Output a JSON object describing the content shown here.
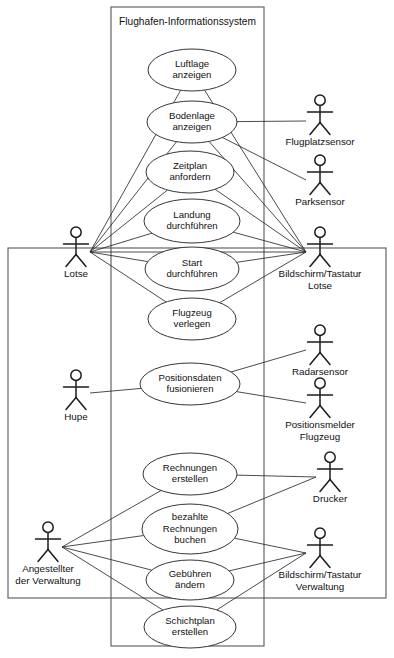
{
  "diagram": {
    "kind": "uml-use-case-diagram",
    "system": {
      "title": "Flughafen-Informationssystem",
      "box": {
        "x": 111,
        "y": 7,
        "width": 153,
        "height": 639
      }
    },
    "outer_box": {
      "x": 8,
      "y": 248,
      "width": 378,
      "height": 350
    },
    "colors": {
      "stroke": "#2b2b2b",
      "box_stroke": "#58585a",
      "fill": "#ffffff",
      "text": "#111111"
    },
    "use_cases": [
      {
        "id": "uc-luftlage-anzeigen",
        "lines": [
          "Luftlage",
          "anzeigen"
        ],
        "cx": 192,
        "cy": 70,
        "rx": 44,
        "ry": 21
      },
      {
        "id": "uc-bodenlage-anzeigen",
        "lines": [
          "Bodenlage",
          "anzeigen"
        ],
        "cx": 192,
        "cy": 122,
        "rx": 45,
        "ry": 21
      },
      {
        "id": "uc-zeitplan-anfordern",
        "lines": [
          "Zeitplan",
          "anfordern"
        ],
        "cx": 190,
        "cy": 172,
        "rx": 44,
        "ry": 21
      },
      {
        "id": "uc-landung-durchfuehren",
        "lines": [
          "Landung",
          "durchführen"
        ],
        "cx": 192,
        "cy": 221,
        "rx": 48,
        "ry": 22
      },
      {
        "id": "uc-start-durchfuehren",
        "lines": [
          "Start",
          "durchführen"
        ],
        "cx": 192,
        "cy": 269,
        "rx": 47,
        "ry": 22
      },
      {
        "id": "uc-flugzeug-verlegen",
        "lines": [
          "Flugzeug",
          "verlegen"
        ],
        "cx": 192,
        "cy": 319,
        "rx": 44,
        "ry": 21
      },
      {
        "id": "uc-positionsdaten-fusionieren",
        "lines": [
          "Positionsdaten",
          "fusionieren"
        ],
        "cx": 190,
        "cy": 384,
        "rx": 50,
        "ry": 21
      },
      {
        "id": "uc-rechnungen-erstellen",
        "lines": [
          "Rechnungen",
          "erstellen"
        ],
        "cx": 190,
        "cy": 474,
        "rx": 47,
        "ry": 21
      },
      {
        "id": "uc-bezahlte-rechnungen-buchen",
        "lines": [
          "bezahlte",
          "Rechnungen",
          "buchen"
        ],
        "cx": 190,
        "cy": 529,
        "rx": 48,
        "ry": 25
      },
      {
        "id": "uc-gebuehren-aendern",
        "lines": [
          "Gebühren",
          "ändern"
        ],
        "cx": 190,
        "cy": 580,
        "rx": 44,
        "ry": 20
      },
      {
        "id": "uc-schichtplan-erstellen",
        "lines": [
          "Schichtplan",
          "erstellen"
        ],
        "cx": 190,
        "cy": 627,
        "rx": 46,
        "ry": 21
      }
    ],
    "actors": [
      {
        "id": "actor-lotse",
        "lines": [
          "Lotse"
        ],
        "x": 76,
        "y": 227,
        "hub_x": 90,
        "hub_y": 252,
        "side": "right"
      },
      {
        "id": "actor-hupe",
        "lines": [
          "Hupe"
        ],
        "x": 76,
        "y": 370,
        "hub_x": 90,
        "hub_y": 393,
        "side": "right"
      },
      {
        "id": "actor-angestellter-der-verwaltung",
        "lines": [
          "Angestellter",
          "der Verwaltung"
        ],
        "x": 48,
        "y": 522,
        "hub_x": 62,
        "hub_y": 547,
        "side": "right"
      },
      {
        "id": "actor-flugplatzsensor",
        "lines": [
          "Flugplatzsensor"
        ],
        "x": 320,
        "y": 95,
        "hub_x": 306,
        "hub_y": 121,
        "side": "left"
      },
      {
        "id": "actor-parksensor",
        "lines": [
          "Parksensor"
        ],
        "x": 320,
        "y": 155,
        "hub_x": 306,
        "hub_y": 180,
        "side": "left"
      },
      {
        "id": "actor-bildschirm-tastatur-lotse",
        "lines": [
          "Bildschirm/Tastatur",
          "Lotse"
        ],
        "x": 320,
        "y": 227,
        "hub_x": 306,
        "hub_y": 252,
        "side": "left"
      },
      {
        "id": "actor-radarsensor",
        "lines": [
          "Radarsensor"
        ],
        "x": 320,
        "y": 325,
        "hub_x": 306,
        "hub_y": 350,
        "side": "left"
      },
      {
        "id": "actor-positionsmelder-flugzeug",
        "lines": [
          "Positionsmelder",
          "Flugzeug"
        ],
        "x": 320,
        "y": 378,
        "hub_x": 306,
        "hub_y": 403,
        "side": "left"
      },
      {
        "id": "actor-drucker",
        "lines": [
          "Drucker"
        ],
        "x": 330,
        "y": 452,
        "hub_x": 316,
        "hub_y": 477,
        "side": "left"
      },
      {
        "id": "actor-bildschirm-tastatur-verwaltung",
        "lines": [
          "Bildschirm/Tastatur",
          "Verwaltung"
        ],
        "x": 320,
        "y": 528,
        "hub_x": 306,
        "hub_y": 553,
        "side": "left"
      }
    ],
    "associations": [
      {
        "from": "actor-lotse",
        "to": "uc-luftlage-anzeigen"
      },
      {
        "from": "actor-lotse",
        "to": "uc-bodenlage-anzeigen"
      },
      {
        "from": "actor-lotse",
        "to": "uc-zeitplan-anfordern"
      },
      {
        "from": "actor-lotse",
        "to": "uc-landung-durchfuehren"
      },
      {
        "from": "actor-lotse",
        "to": "uc-start-durchfuehren"
      },
      {
        "from": "actor-lotse",
        "to": "uc-flugzeug-verlegen"
      },
      {
        "from": "actor-lotse",
        "to": "actor-bildschirm-tastatur-lotse"
      },
      {
        "from": "uc-luftlage-anzeigen",
        "to": "actor-bildschirm-tastatur-lotse"
      },
      {
        "from": "uc-bodenlage-anzeigen",
        "to": "actor-bildschirm-tastatur-lotse"
      },
      {
        "from": "uc-zeitplan-anfordern",
        "to": "actor-bildschirm-tastatur-lotse"
      },
      {
        "from": "uc-landung-durchfuehren",
        "to": "actor-bildschirm-tastatur-lotse"
      },
      {
        "from": "uc-start-durchfuehren",
        "to": "actor-bildschirm-tastatur-lotse"
      },
      {
        "from": "uc-flugzeug-verlegen",
        "to": "actor-bildschirm-tastatur-lotse"
      },
      {
        "from": "uc-bodenlage-anzeigen",
        "to": "actor-flugplatzsensor"
      },
      {
        "from": "uc-bodenlage-anzeigen",
        "to": "actor-parksensor"
      },
      {
        "from": "actor-hupe",
        "to": "uc-positionsdaten-fusionieren"
      },
      {
        "from": "uc-positionsdaten-fusionieren",
        "to": "actor-radarsensor"
      },
      {
        "from": "uc-positionsdaten-fusionieren",
        "to": "actor-positionsmelder-flugzeug"
      },
      {
        "from": "actor-angestellter-der-verwaltung",
        "to": "uc-rechnungen-erstellen"
      },
      {
        "from": "actor-angestellter-der-verwaltung",
        "to": "uc-bezahlte-rechnungen-buchen"
      },
      {
        "from": "actor-angestellter-der-verwaltung",
        "to": "uc-gebuehren-aendern"
      },
      {
        "from": "actor-angestellter-der-verwaltung",
        "to": "uc-schichtplan-erstellen"
      },
      {
        "from": "uc-rechnungen-erstellen",
        "to": "actor-drucker"
      },
      {
        "from": "uc-bezahlte-rechnungen-buchen",
        "to": "actor-drucker"
      },
      {
        "from": "uc-bezahlte-rechnungen-buchen",
        "to": "actor-bildschirm-tastatur-verwaltung"
      },
      {
        "from": "uc-gebuehren-aendern",
        "to": "actor-bildschirm-tastatur-verwaltung"
      },
      {
        "from": "uc-schichtplan-erstellen",
        "to": "actor-bildschirm-tastatur-verwaltung"
      }
    ]
  }
}
